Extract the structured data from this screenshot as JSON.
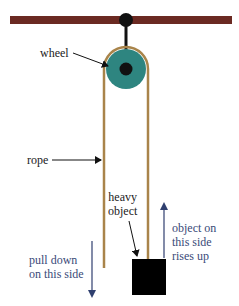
{
  "diagram": {
    "type": "single fixed pulley",
    "colors": {
      "beam": "#6b2a22",
      "mount": "#111111",
      "wheel": "#2e8580",
      "wheel_rim": "#b89a58",
      "rope": "#a9844a",
      "object": "#000000",
      "motion_arrow": "#2f3f6f",
      "label_text": "#222222",
      "motion_text": "#3a4a78"
    },
    "labels": {
      "wheel": "wheel",
      "rope": "rope",
      "heavy_object_line1": "heavy",
      "heavy_object_line2": "object",
      "pull_line1": "pull down",
      "pull_line2": "on this side",
      "rise_line1": "object on",
      "rise_line2": "this side",
      "rise_line3": "rises up"
    }
  }
}
